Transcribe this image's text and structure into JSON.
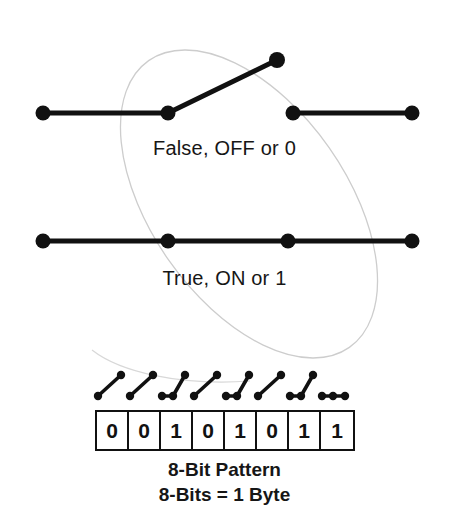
{
  "diagram": {
    "title_alt": "Switch states and 8-bit pattern",
    "colors": {
      "stroke": "#111111",
      "ellipse": "#cfcfcf",
      "background": "#ffffff",
      "text": "#161616"
    },
    "labels": {
      "off_state": "False, OFF or 0",
      "on_state": "True, ON or 1"
    },
    "captions": {
      "line1": "8-Bit Pattern",
      "line2": "8-Bits = 1 Byte"
    },
    "open_switch": {
      "name": "open-switch-diagram",
      "state": "open",
      "meaning": "False, OFF or 0",
      "left_terminal": {
        "x": 43,
        "y": 113
      },
      "pivot": {
        "x": 168,
        "y": 113
      },
      "raised_tip": {
        "x": 277,
        "y": 60
      },
      "right_terminal_start": {
        "x": 293,
        "y": 113
      },
      "right_terminal_end": {
        "x": 412,
        "y": 113
      }
    },
    "closed_switch": {
      "name": "closed-switch-diagram",
      "state": "closed",
      "meaning": "True, ON or 1",
      "y": 241,
      "dots_x": [
        43,
        168,
        288,
        412
      ]
    },
    "ellipse": {
      "name": "hand-drawn-ellipse",
      "center_x": 249,
      "center_y": 204,
      "radius_x": 98,
      "radius_y": 175,
      "rotation_deg": -35,
      "stroke_width": 1.2
    },
    "switch_row": {
      "name": "eight-switch-row",
      "baseline_y": 396,
      "tip_y": 375,
      "switch_span": 32,
      "start_x": 95,
      "switches": [
        {
          "index": 0,
          "state": "open",
          "bit": "0"
        },
        {
          "index": 1,
          "state": "open",
          "bit": "0"
        },
        {
          "index": 2,
          "state": "closed",
          "bit": "1"
        },
        {
          "index": 3,
          "state": "open",
          "bit": "0"
        },
        {
          "index": 4,
          "state": "closed",
          "bit": "1"
        },
        {
          "index": 5,
          "state": "open",
          "bit": "0"
        },
        {
          "index": 6,
          "state": "closed",
          "bit": "1"
        },
        {
          "index": 7,
          "state": "closed",
          "bit": "1"
        }
      ]
    },
    "bits": [
      "0",
      "0",
      "1",
      "0",
      "1",
      "0",
      "1",
      "1"
    ],
    "bit_string": "00101011"
  }
}
